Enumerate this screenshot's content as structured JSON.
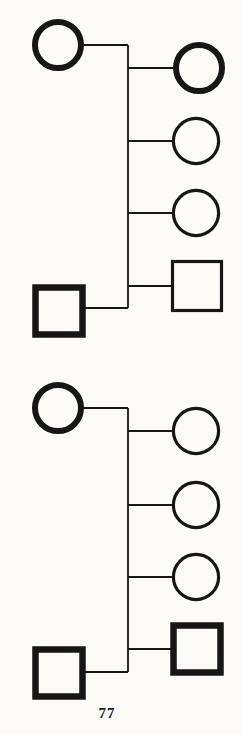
{
  "page": {
    "number": "77",
    "paper_color": "#fcfbf7",
    "ink_color": "#161616"
  },
  "diagram": {
    "type": "pedigree-charts",
    "connector_width": 1.8,
    "shapes": {
      "circle": {
        "bold": {
          "r": 23,
          "stroke": 6
        },
        "thin": {
          "r": 22.6,
          "stroke": 3.2
        }
      },
      "square": {
        "bold": {
          "size": 47,
          "stroke": 6.5
        },
        "thin": {
          "size": 49,
          "stroke": 3.2
        }
      }
    },
    "pedigrees": [
      {
        "id": "pedigree-1",
        "sibship_line": {
          "x": 128,
          "y1": 45,
          "y2": 308
        },
        "members": [
          {
            "id": "pedigree-1-parent-female",
            "role": "parent",
            "shape": "circle",
            "bold": true,
            "cx": 58,
            "cy": 45,
            "link_y": 45
          },
          {
            "id": "pedigree-1-parent-male",
            "role": "parent",
            "shape": "square",
            "bold": true,
            "cx": 59,
            "cy": 311,
            "link_y": 308
          },
          {
            "id": "pedigree-1-child-1",
            "role": "child",
            "shape": "circle",
            "bold": true,
            "cx": 199,
            "cy": 68
          },
          {
            "id": "pedigree-1-child-2",
            "role": "child",
            "shape": "circle",
            "bold": false,
            "cx": 196,
            "cy": 141
          },
          {
            "id": "pedigree-1-child-3",
            "role": "child",
            "shape": "circle",
            "bold": false,
            "cx": 196,
            "cy": 213
          },
          {
            "id": "pedigree-1-child-4",
            "role": "child",
            "shape": "square",
            "bold": false,
            "cx": 197,
            "cy": 286
          }
        ]
      },
      {
        "id": "pedigree-2",
        "sibship_line": {
          "x": 128,
          "y1": 408,
          "y2": 672
        },
        "members": [
          {
            "id": "pedigree-2-parent-female",
            "role": "parent",
            "shape": "circle",
            "bold": true,
            "cx": 58,
            "cy": 408,
            "link_y": 408
          },
          {
            "id": "pedigree-2-parent-male",
            "role": "parent",
            "shape": "square",
            "bold": true,
            "cx": 59,
            "cy": 673,
            "link_y": 672
          },
          {
            "id": "pedigree-2-child-1",
            "role": "child",
            "shape": "circle",
            "bold": false,
            "cx": 196,
            "cy": 431
          },
          {
            "id": "pedigree-2-child-2",
            "role": "child",
            "shape": "circle",
            "bold": false,
            "cx": 196,
            "cy": 505
          },
          {
            "id": "pedigree-2-child-3",
            "role": "child",
            "shape": "circle",
            "bold": false,
            "cx": 196,
            "cy": 577
          },
          {
            "id": "pedigree-2-child-4",
            "role": "child",
            "shape": "square",
            "bold": true,
            "cx": 197,
            "cy": 649
          }
        ]
      }
    ]
  }
}
